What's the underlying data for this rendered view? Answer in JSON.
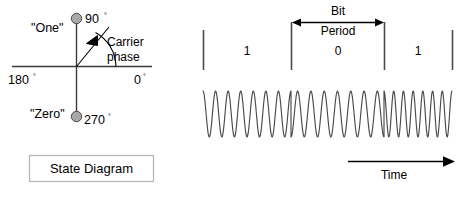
{
  "figure": {
    "type": "bpsk-modulation-diagram"
  },
  "state_diagram": {
    "caption": "State Diagram",
    "label_one": "\"One\"",
    "label_zero": "\"Zero\"",
    "axis_labels": {
      "right": "0",
      "left": "180",
      "top": "90",
      "bottom": "270",
      "degree_symbol": "°"
    },
    "annotation_line1": "Carrier",
    "annotation_line2": "phase",
    "constellation_points": [
      {
        "name": "one",
        "angle_deg": 90,
        "label": "\"One\"",
        "degree_label": "90"
      },
      {
        "name": "zero",
        "angle_deg": 270,
        "label": "\"Zero\"",
        "degree_label": "270"
      }
    ],
    "carrier_phase_arrow_angle_deg": 68,
    "colors": {
      "dot_fill": "#a8a8a8",
      "dot_stroke": "#4a4a4a",
      "axis": "#3a3a3a",
      "box_border": "#b4b4b4"
    }
  },
  "waveform": {
    "bit_period_label_line1": "Bit",
    "bit_period_label_line2": "Period",
    "time_label": "Time",
    "bits": [
      "1",
      "0",
      "1"
    ],
    "bit_boundaries_px": [
      203,
      291,
      384,
      452
    ],
    "stroke_color": "#4a4a4a"
  },
  "chart_data": {
    "type": "line",
    "xlabel": "Time",
    "ylabel": "",
    "series": [
      {
        "name": "carrier",
        "description": "Sinusoidal carrier with 180-degree phase reversals at bit boundaries",
        "cycles_per_bit": 7,
        "amplitude": 1,
        "phase_by_bit_deg": [
          90,
          270,
          90
        ]
      }
    ],
    "categories": [
      "1",
      "0",
      "1"
    ],
    "annotations": [
      "Bit Period",
      "Time"
    ],
    "grid": false,
    "legend": "none"
  }
}
